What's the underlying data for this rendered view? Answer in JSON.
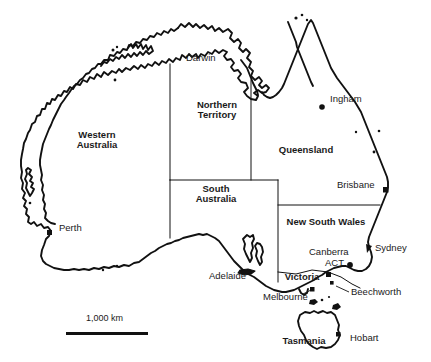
{
  "map": {
    "title": "Map of Australia",
    "background_color": "#ffffff",
    "line_color": "#111111",
    "states": [
      {
        "name": "western-australia",
        "label": "Western\nAustralia",
        "line1": "Western",
        "line2": "Australia",
        "x": 96,
        "y": 138
      },
      {
        "name": "northern-territory",
        "label": "Northern\nTerritory",
        "line1": "Northern",
        "line2": "Territory",
        "x": 217,
        "y": 107
      },
      {
        "name": "queensland",
        "label": "Queensland",
        "line1": "Queensland",
        "line2": "",
        "x": 306,
        "y": 150
      },
      {
        "name": "south-australia",
        "label": "South\nAustralia",
        "line1": "South",
        "line2": "Australia",
        "x": 216,
        "y": 191
      },
      {
        "name": "new-south-wales",
        "label": "New South Wales",
        "line1": "New South Wales",
        "line2": "",
        "x": 326,
        "y": 222
      },
      {
        "name": "victoria",
        "label": "Victoria",
        "line1": "Victoria",
        "line2": "",
        "x": 301,
        "y": 277
      },
      {
        "name": "tasmania",
        "label": "Tasmania",
        "line1": "Tasmania",
        "line2": "",
        "x": 303,
        "y": 341
      }
    ],
    "cities": [
      {
        "name": "darwin",
        "label": "Darwin",
        "label_x": 186,
        "label_y": 58,
        "dot_x": 0,
        "dot_y": 0,
        "has_dot": false
      },
      {
        "name": "ingham",
        "label": "Ingham",
        "label_x": 330,
        "label_y": 98,
        "dot_x": 322,
        "dot_y": 107,
        "has_dot": true
      },
      {
        "name": "brisbane",
        "label": "Brisbane",
        "label_x": 337,
        "label_y": 184,
        "dot_x": 385,
        "dot_y": 190,
        "has_dot": true
      },
      {
        "name": "perth",
        "label": "Perth",
        "label_x": 59,
        "label_y": 227,
        "dot_x": 50,
        "dot_y": 233,
        "has_dot": true
      },
      {
        "name": "sydney",
        "label": "Sydney",
        "label_x": 375,
        "label_y": 248,
        "dot_x": 369,
        "dot_y": 249,
        "has_dot": true
      },
      {
        "name": "canberra",
        "label": "Canberra",
        "label_x": 311,
        "label_y": 252,
        "dot_x": 348,
        "dot_y": 265,
        "has_dot": true
      },
      {
        "name": "act",
        "label": "ACT",
        "label_x": 327,
        "label_y": 263,
        "dot_x": 0,
        "dot_y": 0,
        "has_dot": false
      },
      {
        "name": "adelaide",
        "label": "Adelaide",
        "label_x": 211,
        "label_y": 276,
        "dot_x": 0,
        "dot_y": 0,
        "has_dot": false
      },
      {
        "name": "melbourne",
        "label": "Melbourne",
        "label_x": 265,
        "label_y": 297,
        "dot_x": 0,
        "dot_y": 0,
        "has_dot": false
      },
      {
        "name": "beechworth",
        "label": "Beechworth",
        "label_x": 351,
        "label_y": 292,
        "dot_x": 0,
        "dot_y": 0,
        "has_dot": false
      },
      {
        "name": "hobart",
        "label": "Hobart",
        "label_x": 352,
        "label_y": 338,
        "dot_x": 0,
        "dot_y": 0,
        "has_dot": false
      }
    ],
    "scale": {
      "label": "1,000 km",
      "label_x": 90,
      "label_y": 317,
      "bar_x": 66,
      "bar_y": 332,
      "bar_width": 82,
      "bar_height": 3
    }
  }
}
